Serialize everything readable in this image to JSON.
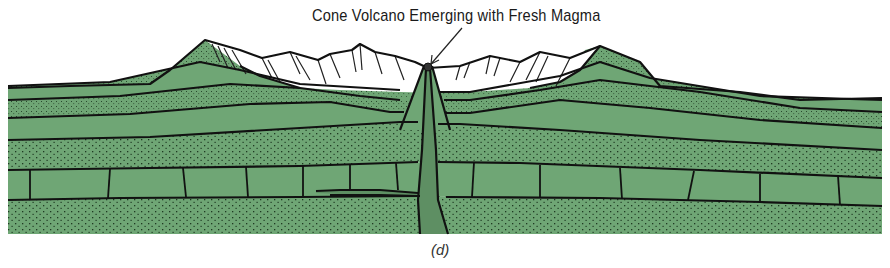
{
  "figure": {
    "annotation": "Cone Volcano Emerging with Fresh Magma",
    "panel_label": "(d)",
    "colors": {
      "strata_green": "#6fa675",
      "strata_dark_green": "#5c9163",
      "conduit_green": "#5e8f63",
      "snow_white": "#ffffff",
      "outline": "#111111",
      "stipple": "#1f3a22"
    },
    "layers": [
      "stippled surface layer",
      "plain green layer",
      "stippled layer",
      "plain green layer",
      "stippled thick layer",
      "jointed block layer",
      "stippled base layer"
    ],
    "features": [
      "left mountain peak",
      "white snow-covered central range",
      "right mountain peak",
      "central cone volcano",
      "magma conduit",
      "sill intrusion"
    ]
  }
}
